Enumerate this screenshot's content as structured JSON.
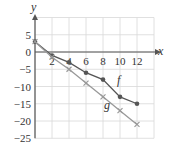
{
  "chart_data": {
    "type": "line",
    "title": "",
    "xlabel": "x",
    "ylabel": "y",
    "xlim": [
      -2,
      14
    ],
    "ylim": [
      -25,
      10
    ],
    "grid": true,
    "x_ticks": [
      2,
      4,
      6,
      8,
      10,
      12
    ],
    "x_tick_labels": [
      "2",
      "4",
      "6",
      "8",
      "10",
      "12"
    ],
    "y_ticks": [
      5,
      0,
      -5,
      -10,
      -15,
      -20,
      -25
    ],
    "y_tick_labels": [
      "5",
      "0",
      "−5",
      "−10",
      "−15",
      "−20",
      "−25"
    ],
    "series": [
      {
        "name": "f",
        "marker": "dot",
        "color": "#555555",
        "x": [
          0,
          2,
          4,
          6,
          8,
          10,
          12
        ],
        "y": [
          3,
          -1,
          -3,
          -6,
          -8,
          -13,
          -15
        ]
      },
      {
        "name": "g",
        "marker": "cross",
        "color": "#999999",
        "x": [
          0,
          2,
          4,
          6,
          8,
          10,
          12
        ],
        "y": [
          3,
          -1.5,
          -5,
          -9,
          -13,
          -17,
          -21
        ]
      }
    ],
    "annotations": [
      {
        "text": "f",
        "near": "f at x≈10.5"
      },
      {
        "text": "g",
        "near": "g at x≈8.5"
      }
    ]
  },
  "colors": {
    "grid": "#d8d8d8",
    "axis": "#555555",
    "f": "#555555",
    "g": "#999999"
  }
}
